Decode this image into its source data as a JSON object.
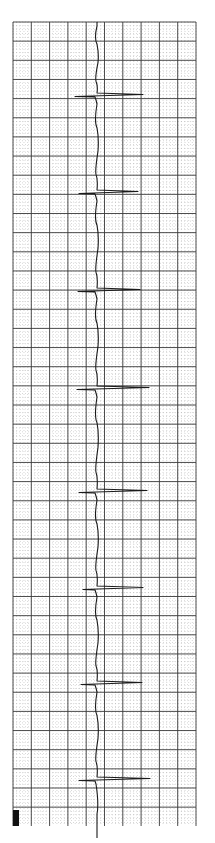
{
  "strip": {
    "type": "ecg-rhythm-strip",
    "orientation": "vertical",
    "grid": {
      "left": 13,
      "top": 22,
      "right": 196,
      "bottom": 826,
      "major_spacing_x": 18.3,
      "major_spacing_y": 19.15,
      "minor_per_major": 5,
      "major_color": "#3a3a3a",
      "minor_color": "#9a9a9a"
    },
    "trace_color": "#1a1a1a",
    "baseline_x": 97,
    "calibration_block": {
      "x": 13,
      "y": 810,
      "w": 6,
      "h": 16,
      "color": "#111111"
    },
    "beats": [
      {
        "y": 96,
        "left": 75,
        "right": 143
      },
      {
        "y": 193,
        "left": 79,
        "right": 138
      },
      {
        "y": 291,
        "left": 78,
        "right": 140
      },
      {
        "y": 389,
        "left": 77,
        "right": 149
      },
      {
        "y": 492,
        "left": 79,
        "right": 147
      },
      {
        "y": 589,
        "left": 83,
        "right": 143
      },
      {
        "y": 684,
        "left": 81,
        "right": 142
      },
      {
        "y": 780,
        "left": 79,
        "right": 150
      }
    ]
  }
}
